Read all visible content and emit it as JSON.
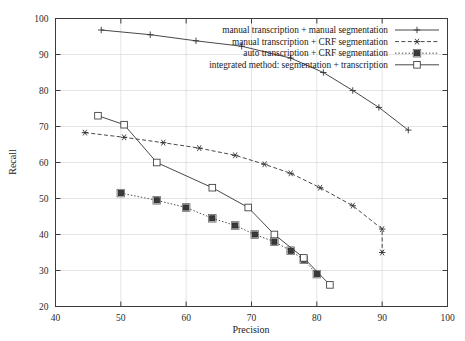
{
  "chart_data": {
    "type": "line",
    "title": "",
    "xlabel": "Precision",
    "ylabel": "Recall",
    "xlim": [
      40,
      100
    ],
    "ylim": [
      20,
      100
    ],
    "xticks": [
      40,
      50,
      60,
      70,
      80,
      90,
      100
    ],
    "yticks": [
      20,
      30,
      40,
      50,
      60,
      70,
      80,
      90,
      100
    ],
    "grid": true,
    "legend_position": "top-right",
    "series": [
      {
        "name": "manual transcription + manual segmentation",
        "marker": "plus",
        "linestyle": "solid",
        "points": [
          {
            "x": 47.0,
            "y": 96.8
          },
          {
            "x": 54.5,
            "y": 95.5
          },
          {
            "x": 61.5,
            "y": 93.8
          },
          {
            "x": 68.5,
            "y": 92.3
          },
          {
            "x": 76.0,
            "y": 89.0
          },
          {
            "x": 81.0,
            "y": 85.0
          },
          {
            "x": 85.5,
            "y": 80.0
          },
          {
            "x": 89.5,
            "y": 75.3
          },
          {
            "x": 94.0,
            "y": 69.0
          }
        ]
      },
      {
        "name": "manual transcription + CRF segmentation",
        "marker": "star",
        "linestyle": "dashed",
        "points": [
          {
            "x": 44.5,
            "y": 68.3
          },
          {
            "x": 50.5,
            "y": 67.0
          },
          {
            "x": 56.5,
            "y": 65.5
          },
          {
            "x": 62.0,
            "y": 64.0
          },
          {
            "x": 67.5,
            "y": 62.0
          },
          {
            "x": 72.0,
            "y": 59.5
          },
          {
            "x": 76.0,
            "y": 57.0
          },
          {
            "x": 80.5,
            "y": 53.0
          },
          {
            "x": 85.5,
            "y": 48.0
          },
          {
            "x": 90.0,
            "y": 41.5
          },
          {
            "x": 90.0,
            "y": 35.0
          }
        ]
      },
      {
        "name": "auto transcription + CRF segmentation",
        "marker": "filled-square",
        "linestyle": "dotted",
        "points": [
          {
            "x": 50.0,
            "y": 51.5
          },
          {
            "x": 55.5,
            "y": 49.5
          },
          {
            "x": 60.0,
            "y": 47.5
          },
          {
            "x": 64.0,
            "y": 44.5
          },
          {
            "x": 67.5,
            "y": 42.5
          },
          {
            "x": 70.5,
            "y": 40.0
          },
          {
            "x": 73.5,
            "y": 38.0
          },
          {
            "x": 76.0,
            "y": 35.5
          },
          {
            "x": 78.0,
            "y": 33.0
          },
          {
            "x": 80.0,
            "y": 29.0
          }
        ]
      },
      {
        "name": "integrated method: segmentation + transcription",
        "marker": "open-square",
        "linestyle": "solid",
        "points": [
          {
            "x": 46.5,
            "y": 73.0
          },
          {
            "x": 50.5,
            "y": 70.5
          },
          {
            "x": 55.5,
            "y": 60.0
          },
          {
            "x": 64.0,
            "y": 53.0
          },
          {
            "x": 69.5,
            "y": 47.5
          },
          {
            "x": 73.5,
            "y": 40.0
          },
          {
            "x": 78.0,
            "y": 33.5
          },
          {
            "x": 82.0,
            "y": 26.0
          }
        ]
      }
    ]
  },
  "legend": {
    "entries": [
      {
        "label": "manual transcription + manual segmentation",
        "marker": "plus"
      },
      {
        "label": "manual transcription + CRF segmentation",
        "marker": "star"
      },
      {
        "label": "auto transcription + CRF segmentation",
        "marker": "filled-square"
      },
      {
        "label": "integrated method: segmentation + transcription",
        "marker": "open-square"
      }
    ]
  },
  "colors": {
    "axis": "#3c3c3c",
    "grid": "#d8d8d8",
    "line": "#333333",
    "background": "#ffffff"
  }
}
